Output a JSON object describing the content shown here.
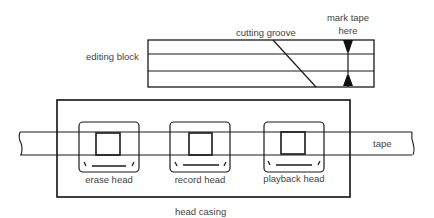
{
  "diagram": {
    "editing_block": {
      "label": "editing block",
      "cutting_groove_label": "cutting groove",
      "mark_tape_label_line1": "mark tape",
      "mark_tape_label_line2": "here"
    },
    "tape": {
      "label": "tape"
    },
    "head_casing": {
      "label": "head casing"
    },
    "heads": [
      {
        "label": "erase head"
      },
      {
        "label": "record head"
      },
      {
        "label": "playback head"
      }
    ],
    "colors": {
      "line": "#1a1a1a",
      "text": "#444444",
      "background": "#ffffff"
    }
  }
}
